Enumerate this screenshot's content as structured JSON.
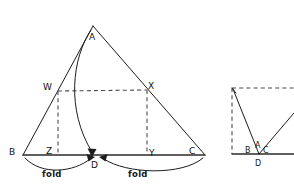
{
  "figure": {
    "background_color": "#ffffff",
    "ink_color": "#1c1c1c",
    "dashed_color": "#4a4a4a",
    "left_diagram": {
      "name": "triangle-fold-diagram",
      "vertices": {
        "A": {
          "label": "A",
          "x": 93,
          "y": 26
        },
        "B": {
          "label": "B",
          "x": 23,
          "y": 155
        },
        "C": {
          "label": "C",
          "x": 205,
          "y": 155
        },
        "D": {
          "label": "D",
          "x": 96,
          "y": 157
        },
        "W": {
          "label": "W",
          "x": 58,
          "y": 91
        },
        "X": {
          "label": "X",
          "x": 147,
          "y": 90
        },
        "Y": {
          "label": "Y",
          "x": 147,
          "y": 155
        },
        "Z": {
          "label": "Z",
          "x": 58,
          "y": 155
        }
      },
      "label_positions": {
        "A": {
          "x": 89,
          "y": 40
        },
        "B": {
          "x": 9,
          "y": 155
        },
        "C": {
          "x": 189,
          "y": 154
        },
        "D": {
          "x": 92,
          "y": 167
        },
        "W": {
          "x": 44,
          "y": 90
        },
        "X": {
          "x": 148,
          "y": 89
        },
        "Y": {
          "x": 149,
          "y": 156
        },
        "Z": {
          "x": 46,
          "y": 154
        }
      },
      "annotations": [
        {
          "text": "fold",
          "x": 42,
          "y": 177
        },
        {
          "text": "fold",
          "x": 128,
          "y": 177
        }
      ],
      "line_types": {
        "AB": "solid",
        "AC": "solid",
        "BC": "solid",
        "WX": "dashed",
        "WZ": "dashed",
        "XY": "dashed",
        "A_to_D_arc": "curved-arrow",
        "B_to_D_fold_arc": "curved-arrow",
        "C_to_D_fold_arc": "curved-arrow"
      }
    },
    "right_diagram": {
      "name": "folded-result-diagram",
      "labels": [
        {
          "text": "B",
          "x": 248,
          "y": 152
        },
        {
          "text": "A",
          "x": 257,
          "y": 148
        },
        {
          "text": "C",
          "x": 265,
          "y": 152
        },
        {
          "text": "D",
          "x": 255,
          "y": 165
        }
      ],
      "points": {
        "D": {
          "x": 259,
          "y": 154
        },
        "top_left": {
          "x": 232,
          "y": 88
        },
        "bottom_left": {
          "x": 232,
          "y": 154
        }
      },
      "line_types": {
        "top_edge": "dashed",
        "left_edge": "dashed",
        "bottom_edge": "solid",
        "left_fold_line": "solid",
        "right_fold_line": "solid"
      }
    }
  }
}
